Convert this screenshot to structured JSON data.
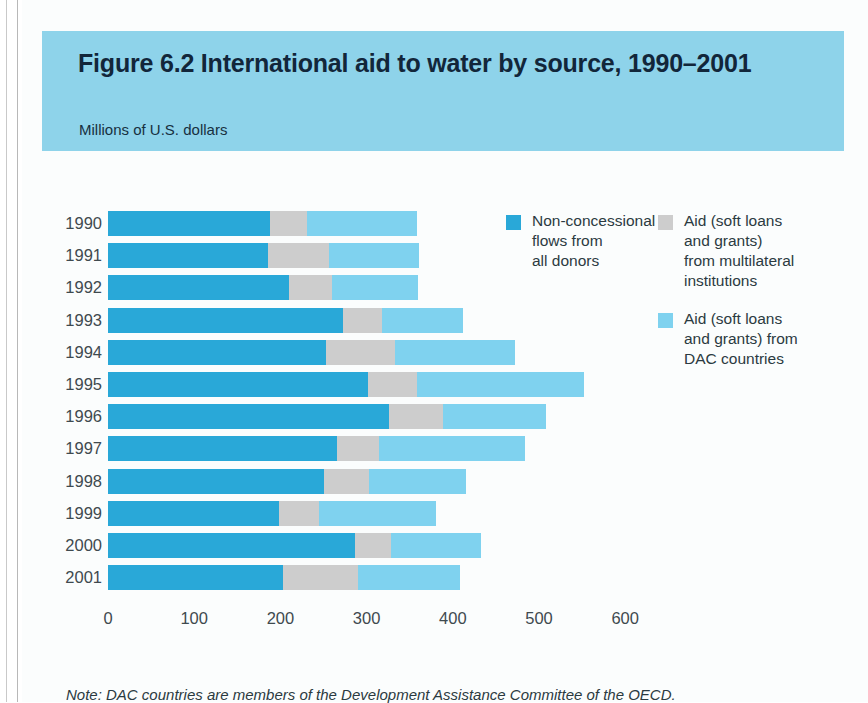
{
  "figure": {
    "title": "Figure 6.2  International aid to water by source, 1990–2001",
    "subtitle": "Millions of U.S. dollars",
    "note": "Note: DAC countries are members of the Development Assistance Committee of the OECD."
  },
  "colors": {
    "header_band": "#8ed3ea",
    "non_concessional": "#29a8d8",
    "multilateral": "#cdcdcd",
    "dac": "#7fd2ef",
    "background": "#fbfdfd",
    "text": "#2b3a41"
  },
  "legend": {
    "entries": [
      {
        "label": "Non-concessional\nflows from\nall donors",
        "color": "#29a8d8",
        "icon": "legend-swatch-non-concessional"
      },
      {
        "label": "Aid (soft loans\nand grants)\nfrom multilateral\ninstitutions",
        "color": "#cdcdcd",
        "icon": "legend-swatch-multilateral"
      },
      {
        "label": "Aid (soft loans\nand grants) from\nDAC countries",
        "color": "#7fd2ef",
        "icon": "legend-swatch-dac"
      }
    ]
  },
  "chart_data": {
    "type": "bar",
    "orientation": "horizontal",
    "stacked": true,
    "title": "Figure 6.2  International aid to water by source, 1990–2001",
    "subtitle": "Millions of U.S. dollars",
    "xlabel": "Millions of U.S. dollars",
    "ylabel": "",
    "xlim": [
      0,
      600
    ],
    "xticks": [
      0,
      100,
      200,
      300,
      400,
      500,
      600
    ],
    "grid": false,
    "legend_position": "top-right",
    "categories": [
      "1990",
      "1991",
      "1992",
      "1993",
      "1994",
      "1995",
      "1996",
      "1997",
      "1998",
      "1999",
      "2000",
      "2001"
    ],
    "series": [
      {
        "name": "Non-concessional flows from all donors",
        "color": "#29a8d8",
        "values": [
          188,
          186,
          210,
          273,
          253,
          302,
          326,
          266,
          250,
          198,
          286,
          203
        ]
      },
      {
        "name": "Aid (soft loans and grants) from multilateral institutions",
        "color": "#cdcdcd",
        "values": [
          43,
          70,
          50,
          45,
          80,
          57,
          63,
          48,
          53,
          47,
          42,
          87
        ]
      },
      {
        "name": "Aid (soft loans and grants) from DAC countries",
        "color": "#7fd2ef",
        "values": [
          128,
          105,
          100,
          94,
          139,
          193,
          119,
          170,
          112,
          136,
          105,
          118
        ]
      }
    ],
    "totals": [
      359,
      361,
      360,
      412,
      472,
      552,
      508,
      484,
      415,
      381,
      433,
      408
    ]
  },
  "axis": {
    "tick_labels": [
      "0",
      "100",
      "200",
      "300",
      "400",
      "500",
      "600"
    ]
  }
}
